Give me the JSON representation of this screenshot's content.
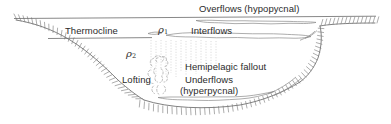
{
  "figure": {
    "background_color": "#ffffff",
    "line_color": "#5a5a5a",
    "text_color": "#2b2b2b",
    "width": 391,
    "height": 124
  },
  "labels": {
    "overflows": "Overflows (hypopycnal)",
    "interflows": "Interflows",
    "thermocline": "Thermocline",
    "hemipelagic": "Hemipelagic fallout",
    "lofting": "Lofting",
    "underflows": "Underflows",
    "hyperpycnal": "(hyperpycnal)",
    "rho1": "ρ",
    "rho1_sub": "1",
    "rho2": "ρ",
    "rho2_sub": "2"
  },
  "features": {
    "water_surface": "water-surface-line",
    "thermocline_line": "thermocline-line",
    "basin_floor": "basin-floor-profile",
    "left_slope": "left-basin-slope",
    "right_shelf": "right-shelf",
    "right_slope": "right-basin-slope",
    "overflow_plume": "overflow-plume-lens",
    "interflow_plume": "interflow-plume-lens",
    "underflow_plume": "underflow-current",
    "lofting_plume": "lofting-cloud",
    "fallout_lines": "hemipelagic-fallout-streaks",
    "hachures": "basin-margin-hachures"
  }
}
